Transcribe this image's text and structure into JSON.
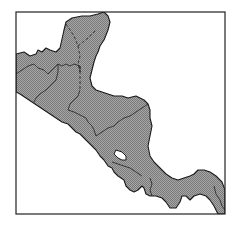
{
  "map": {
    "title": "",
    "region": "Central America",
    "style": {
      "land_fill": "#9a9a9a",
      "hatch_dark": "#7d7d7d",
      "hatch_light": "#b8b8b8",
      "water": "#ffffff",
      "outline": "#1a1a1a"
    },
    "frame": {
      "x": 16,
      "y": 12,
      "width": 209,
      "height": 202
    },
    "countries": [
      {
        "id": "mexico",
        "name": "Mexico"
      },
      {
        "id": "guatemala",
        "name": "Guatemala"
      },
      {
        "id": "belize",
        "name": "Belize"
      },
      {
        "id": "el-salvador",
        "name": "El Salvador"
      },
      {
        "id": "honduras",
        "name": "Honduras"
      },
      {
        "id": "nicaragua",
        "name": "Nicaragua"
      },
      {
        "id": "costa-rica",
        "name": "Costa Rica"
      },
      {
        "id": "panama",
        "name": "Panama"
      }
    ],
    "features": [
      {
        "id": "lake-nicaragua",
        "name": "Lake Nicaragua",
        "type": "lake"
      }
    ]
  }
}
